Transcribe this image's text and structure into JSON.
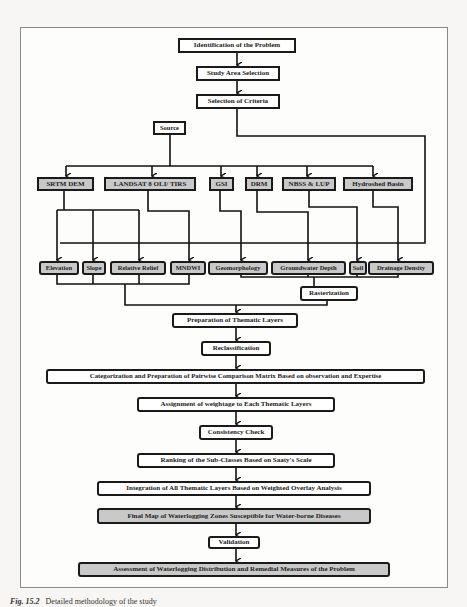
{
  "diagram": {
    "type": "flowchart",
    "steps_top": [
      {
        "id": "identification",
        "label": "Identification of the Problem"
      },
      {
        "id": "study_area",
        "label": "Study Area Selection"
      },
      {
        "id": "criteria",
        "label": "Selection of Criteria"
      }
    ],
    "source": {
      "label": "Source"
    },
    "sources": [
      {
        "id": "srtm",
        "label": "SRTM DEM"
      },
      {
        "id": "landsat",
        "label": "LANDSAT 8 OLI/ TIRS"
      },
      {
        "id": "gsi",
        "label": "GSI"
      },
      {
        "id": "drm",
        "label": "DRM"
      },
      {
        "id": "nbss",
        "label": "NBSS & LUP"
      },
      {
        "id": "hydroshed",
        "label": "Hydroshed Basin"
      }
    ],
    "layers": [
      {
        "id": "elevation",
        "label": "Elevation",
        "from": "SRTM DEM"
      },
      {
        "id": "slope",
        "label": "Slope",
        "from": "SRTM DEM"
      },
      {
        "id": "relief",
        "label": "Relative Relief",
        "from": "SRTM DEM"
      },
      {
        "id": "mndwi",
        "label": "MNDWI",
        "from": "LANDSAT 8 OLI/ TIRS"
      },
      {
        "id": "geomorphology",
        "label": "Geomorphology",
        "from": "GSI"
      },
      {
        "id": "groundwater",
        "label": "Groundwater Depth",
        "from": "DRM"
      },
      {
        "id": "soil",
        "label": "Soil",
        "from": "NBSS & LUP"
      },
      {
        "id": "drainage",
        "label": "Drainage Density",
        "from": "Hydroshed Basin"
      }
    ],
    "rasterization": {
      "label": "Rasterization"
    },
    "steps_bottom": [
      {
        "id": "prep",
        "label": "Preparation of Thematic Layers"
      },
      {
        "id": "reclass",
        "label": "Reclassification"
      },
      {
        "id": "categorization",
        "label": "Categorization and Preparation of Pairwise Comparison Matrix Based on observation and Expertise"
      },
      {
        "id": "assignment",
        "label": "Assignment of weightage to Each Thematic Layers"
      },
      {
        "id": "consistency",
        "label": "Consistency Check"
      },
      {
        "id": "ranking",
        "label": "Ranking of the Sub-Classes Based on Saaty's Scale"
      },
      {
        "id": "integration",
        "label": "Integration of All Thematic Layers Based on Weighted Overlay Analysis"
      },
      {
        "id": "final_map",
        "label": "Final Map of Waterlogging Zones Susceptible for Water-borne Diseases"
      },
      {
        "id": "validation",
        "label": "Validation"
      },
      {
        "id": "assessment",
        "label": "Assessment of Waterlogging Distribution and Remedial Measures of the Problem"
      }
    ]
  },
  "caption": {
    "fig_label": "Fig. 15.2",
    "text": "Detailed methodology of the study"
  },
  "colors": {
    "box_border": "#1a1a1a",
    "box_fill": "#ffffff",
    "box_fill_gray": "#c9c9c9",
    "frame_border": "#8a8a8a"
  }
}
